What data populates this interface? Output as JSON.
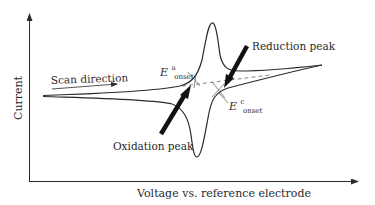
{
  "diagram": {
    "type": "cyclic-voltammogram",
    "axes": {
      "x_label": "Voltage vs. reference electrode",
      "y_label": "Current"
    },
    "annotations": {
      "scan_direction": "Scan direction",
      "oxidation_peak": "Oxidation peak",
      "reduction_peak": "Reduction peak",
      "anodic_onset": {
        "symbol": "E",
        "superscript": "a",
        "subscript": "onset"
      },
      "cathodic_onset": {
        "symbol": "E",
        "superscript": "c",
        "subscript": "onset"
      }
    },
    "colors": {
      "line": "#2a2a2a",
      "arrow": "#111111",
      "background": "#ffffff",
      "dashed": "#555555"
    }
  }
}
